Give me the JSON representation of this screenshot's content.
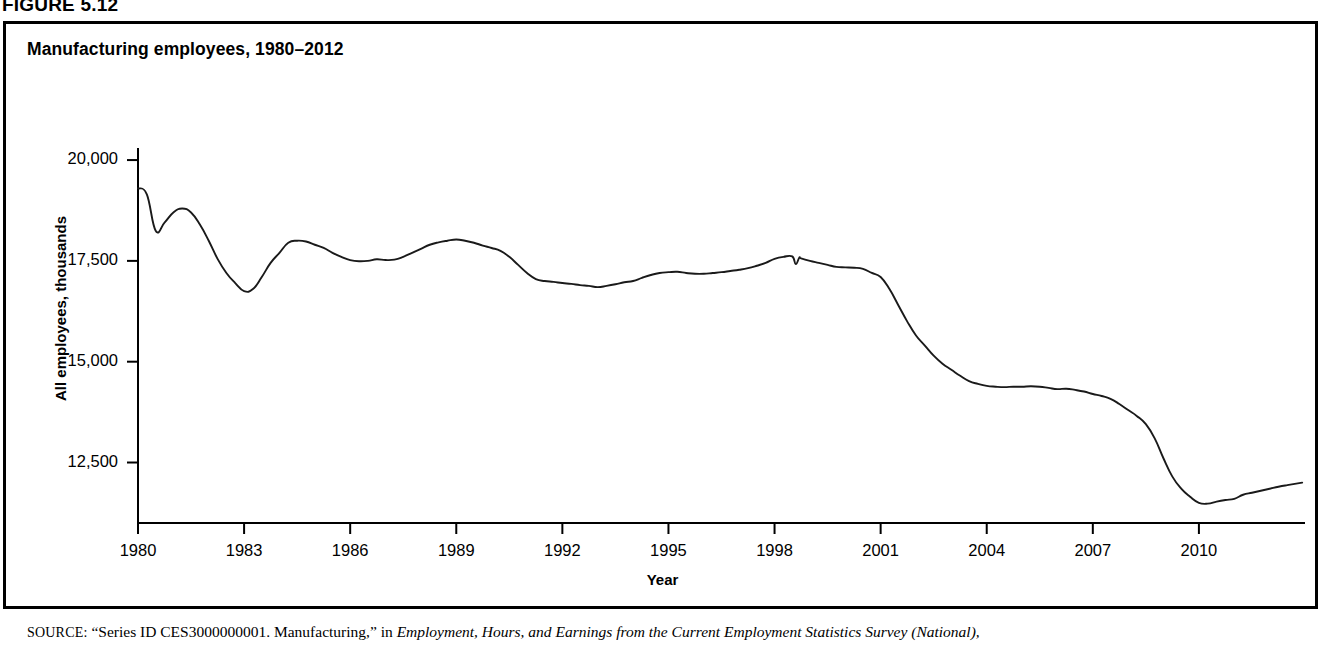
{
  "figure": {
    "number_label": "FIGURE 5.12",
    "title": "Manufacturing employees, 1980–2012",
    "source_prefix": "SOURCE:",
    "source_quoted": "“Series ID CES3000000001. Manufacturing,” in",
    "source_italic": "Employment, Hours, and Earnings from the Current Employment Statistics Survey (National),"
  },
  "axes": {
    "y_title": "All employees, thousands",
    "x_title": "Year",
    "y_ticks": [
      "20,000",
      "17,500",
      "15,000",
      "12,500"
    ],
    "y_tick_values": [
      20000,
      17500,
      15000,
      12500
    ],
    "x_ticks": [
      "1980",
      "1983",
      "1986",
      "1989",
      "1992",
      "1995",
      "1998",
      "2001",
      "2004",
      "2007",
      "2010"
    ],
    "x_tick_values": [
      1980,
      1983,
      1986,
      1989,
      1992,
      1995,
      1998,
      2001,
      2004,
      2007,
      2010
    ]
  },
  "style": {
    "line_color": "#1a1a1a",
    "axis_color": "#000000",
    "background": "#ffffff",
    "border_color": "#000000"
  },
  "chart_data": {
    "type": "line",
    "title": "Manufacturing employees, 1980–2012",
    "xlabel": "Year",
    "ylabel": "All employees, thousands",
    "xlim": [
      1980,
      2013.0
    ],
    "ylim": [
      11000,
      20200
    ],
    "grid": false,
    "legend": false,
    "units": "thousands of employees",
    "series": [
      {
        "name": "Manufacturing employees",
        "x": [
          1980.0,
          1980.25,
          1980.5,
          1980.75,
          1981.0,
          1981.25,
          1981.5,
          1981.75,
          1982.0,
          1982.25,
          1982.5,
          1982.75,
          1983.0,
          1983.25,
          1983.5,
          1983.75,
          1984.0,
          1984.25,
          1984.5,
          1984.75,
          1985.0,
          1985.25,
          1985.5,
          1985.75,
          1986.0,
          1986.25,
          1986.5,
          1986.75,
          1987.0,
          1987.25,
          1987.5,
          1987.75,
          1988.0,
          1988.25,
          1988.5,
          1988.75,
          1989.0,
          1989.25,
          1989.5,
          1989.75,
          1990.0,
          1990.25,
          1990.5,
          1990.75,
          1991.0,
          1991.25,
          1991.5,
          1991.75,
          1992.0,
          1992.25,
          1992.5,
          1992.75,
          1993.0,
          1993.25,
          1993.5,
          1993.75,
          1994.0,
          1994.25,
          1994.5,
          1994.75,
          1995.0,
          1995.25,
          1995.5,
          1995.75,
          1996.0,
          1996.25,
          1996.5,
          1996.75,
          1997.0,
          1997.25,
          1997.5,
          1997.75,
          1998.0,
          1998.25,
          1998.5,
          1998.6,
          1998.7,
          1998.75,
          1999.0,
          1999.25,
          1999.5,
          1999.75,
          2000.0,
          2000.25,
          2000.5,
          2000.75,
          2001.0,
          2001.25,
          2001.5,
          2001.75,
          2002.0,
          2002.25,
          2002.5,
          2002.75,
          2003.0,
          2003.25,
          2003.5,
          2003.75,
          2004.0,
          2004.25,
          2004.5,
          2004.75,
          2005.0,
          2005.25,
          2005.5,
          2005.75,
          2006.0,
          2006.25,
          2006.5,
          2006.75,
          2007.0,
          2007.25,
          2007.5,
          2007.75,
          2008.0,
          2008.25,
          2008.5,
          2008.75,
          2009.0,
          2009.25,
          2009.5,
          2009.75,
          2010.0,
          2010.25,
          2010.5,
          2010.75,
          2011.0,
          2011.25,
          2011.5,
          2011.75,
          2012.0,
          2012.25,
          2012.5,
          2012.92
        ],
        "y": [
          19300,
          19150,
          18250,
          18450,
          18700,
          18800,
          18700,
          18400,
          18000,
          17550,
          17200,
          16950,
          16750,
          16800,
          17100,
          17450,
          17700,
          17950,
          18000,
          17980,
          17900,
          17820,
          17700,
          17600,
          17520,
          17490,
          17500,
          17540,
          17520,
          17530,
          17600,
          17700,
          17800,
          17900,
          17960,
          18000,
          18030,
          18000,
          17950,
          17880,
          17820,
          17750,
          17600,
          17400,
          17200,
          17050,
          17000,
          16980,
          16950,
          16930,
          16900,
          16880,
          16850,
          16880,
          16920,
          16970,
          17000,
          17080,
          17150,
          17200,
          17220,
          17230,
          17200,
          17180,
          17180,
          17200,
          17220,
          17250,
          17280,
          17320,
          17380,
          17450,
          17550,
          17600,
          17610,
          17420,
          17580,
          17560,
          17500,
          17450,
          17400,
          17350,
          17340,
          17330,
          17300,
          17200,
          17100,
          16800,
          16400,
          16000,
          15650,
          15400,
          15150,
          14950,
          14800,
          14650,
          14520,
          14450,
          14400,
          14380,
          14370,
          14380,
          14380,
          14390,
          14380,
          14350,
          14320,
          14330,
          14300,
          14260,
          14200,
          14150,
          14080,
          13950,
          13800,
          13650,
          13450,
          13100,
          12600,
          12150,
          11850,
          11650,
          11500,
          11480,
          11530,
          11570,
          11600,
          11700,
          11750,
          11800,
          11850,
          11900,
          11940,
          12000
        ]
      }
    ],
    "annotations": [
      {
        "label": "1982–83 recession trough",
        "x": 1983.0,
        "y": 16750
      },
      {
        "label": "late-1980s peak",
        "x": 1989.0,
        "y": 18030
      },
      {
        "label": "1998 peak",
        "x": 1998.5,
        "y": 17610
      },
      {
        "label": "2010 trough",
        "x": 2010.25,
        "y": 11480
      }
    ]
  }
}
